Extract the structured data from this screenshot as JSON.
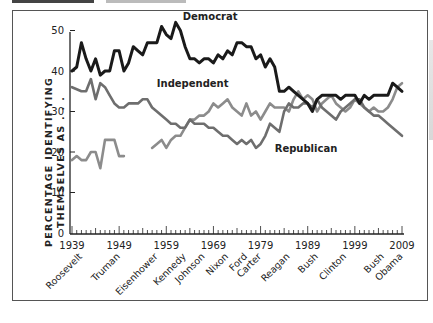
{
  "header": {
    "caption_visible": "partially cut off at top edge (unreadable)"
  },
  "chart_data": {
    "type": "line",
    "title": "",
    "xlabel": "",
    "ylabel": "PERCENTAGE IDENTIFYING THEMSELVES AS . . .",
    "ylabel_lines": [
      "PERCENTAGE IDENTIFYING",
      "THEMSELVES AS . . ."
    ],
    "ylim": [
      0,
      55
    ],
    "yticks": [
      0,
      10,
      20,
      30,
      40,
      50
    ],
    "xlim": [
      1939,
      2009
    ],
    "xticks": [
      1939,
      1949,
      1959,
      1969,
      1979,
      1989,
      1999,
      2009
    ],
    "grid": false,
    "legend": "inline labels",
    "presidents": [
      {
        "name": "Roosevelt",
        "year": 1940
      },
      {
        "name": "Truman",
        "year": 1948
      },
      {
        "name": "Eisenhower",
        "year": 1956
      },
      {
        "name": "Kennedy",
        "year": 1962
      },
      {
        "name": "Johnson",
        "year": 1966
      },
      {
        "name": "Nixon",
        "year": 1971
      },
      {
        "name": "Ford",
        "year": 1975
      },
      {
        "name": "Carter",
        "year": 1978
      },
      {
        "name": "Reagan",
        "year": 1984
      },
      {
        "name": "Bush",
        "year": 1990
      },
      {
        "name": "Clinton",
        "year": 1996
      },
      {
        "name": "Bush",
        "year": 2004
      },
      {
        "name": "Obama",
        "year": 2008
      }
    ],
    "series": [
      {
        "name": "Democrat",
        "color": "#1a1a1a",
        "label_pos": {
          "year": 1962.5,
          "value": 52.5
        },
        "start_year": 1939,
        "values": [
          40,
          41,
          47,
          43,
          40,
          43,
          39,
          40,
          40,
          45,
          45,
          40,
          42,
          46,
          45,
          44,
          47,
          47,
          47,
          51,
          49,
          48,
          52,
          50,
          46,
          43,
          43,
          42,
          43,
          43,
          42,
          44,
          43,
          45,
          44,
          47,
          47,
          46,
          46,
          43,
          44,
          41,
          43,
          41,
          35,
          35,
          36,
          35,
          34,
          33,
          32,
          30,
          33,
          34,
          34,
          34,
          34,
          33,
          34,
          34,
          34,
          32,
          34,
          33,
          34,
          34,
          34,
          34,
          37,
          36,
          35
        ]
      },
      {
        "name": "Republican",
        "color": "#6e6e6e",
        "label_pos": {
          "year": 1982,
          "value": 20
        },
        "start_year": 1939,
        "values": [
          36,
          35.5,
          35,
          35,
          38,
          33,
          37,
          36,
          34,
          32,
          31,
          31,
          32,
          32,
          32,
          33,
          33,
          31,
          30,
          29,
          28,
          27,
          27,
          26,
          26,
          28,
          27,
          27,
          27,
          26,
          26,
          25,
          24,
          24,
          23,
          22,
          23,
          22,
          23,
          21,
          22,
          24,
          27,
          26,
          25,
          30,
          32,
          31,
          31,
          32,
          32,
          31,
          33,
          31,
          30,
          29,
          28,
          30,
          31,
          32,
          33,
          33,
          31,
          30,
          29,
          29,
          28,
          27,
          26,
          25,
          24
        ]
      },
      {
        "name": "Independent",
        "color": "#8c8c8c",
        "label_pos": {
          "year": 1957,
          "value": 36
        },
        "start_year": 1939,
        "values": [
          18,
          19,
          18,
          18,
          20,
          20,
          16,
          23,
          23,
          23,
          19,
          19,
          null,
          null,
          null,
          null,
          null,
          21,
          22,
          23,
          21,
          23,
          24,
          24,
          26,
          28,
          28,
          29,
          29,
          30,
          32,
          31,
          32,
          33,
          31,
          30,
          29,
          32,
          29,
          30,
          28,
          30,
          32,
          31,
          31,
          31,
          30,
          33,
          35,
          33,
          34,
          33,
          30,
          32,
          33,
          34,
          32,
          31,
          30,
          31,
          33,
          32,
          31,
          30,
          31,
          30,
          30,
          31,
          33,
          36,
          37
        ]
      }
    ],
    "series_labels": [
      "Democrat",
      "Independent",
      "Republican"
    ]
  }
}
